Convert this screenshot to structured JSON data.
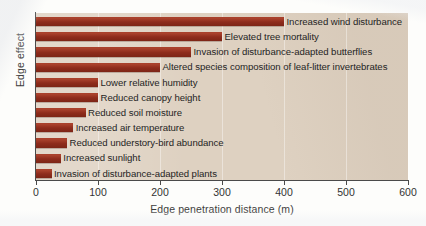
{
  "chart_data": {
    "type": "bar",
    "orientation": "horizontal",
    "title": "",
    "xlabel": "Edge penetration distance (m)",
    "ylabel": "Edge effect",
    "xlim": [
      0,
      600
    ],
    "xticks": [
      0,
      100,
      200,
      300,
      400,
      500,
      600
    ],
    "xtick_labels": [
      "0",
      "100",
      "200",
      "300",
      "400",
      "500",
      "600"
    ],
    "grid": "vertical-light",
    "legend": "none",
    "bar_color": "#93301f",
    "plot_background": "#ded1c1",
    "categories": [
      "Increased wind disturbance",
      "Elevated tree mortality",
      "Invasion of disturbance-adapted butterflies",
      "Altered species composition of leaf-litter invertebrates",
      "Lower relative humidity",
      "Reduced canopy height",
      "Reduced soil moisture",
      "Increased air temperature",
      "Reduced understory-bird abundance",
      "Increased sunlight",
      "Invasion of disturbance-adapted plants"
    ],
    "values": [
      400,
      300,
      250,
      200,
      100,
      100,
      80,
      60,
      50,
      40,
      25
    ]
  }
}
